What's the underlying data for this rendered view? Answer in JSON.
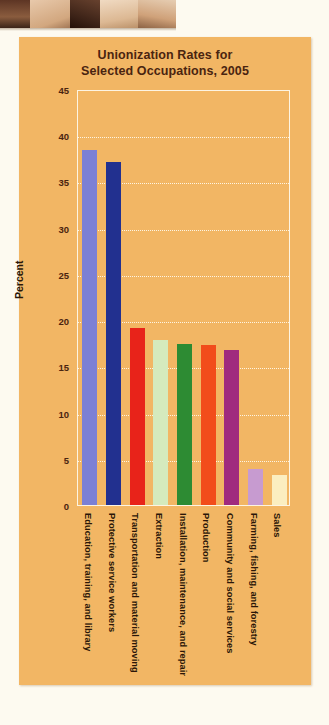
{
  "page": {
    "background_color": "#fdfaf0",
    "photo_strip_name": "cropped-photo-people"
  },
  "chart_panel": {
    "background_color": "#f2b664",
    "plot_border_color": "#fdf4e2",
    "title_line1": "Unionization Rates for",
    "title_line2": "Selected Occupations, 2005"
  },
  "chart_data": {
    "type": "bar",
    "title": "Unionization Rates for Selected Occupations, 2005",
    "xlabel": "",
    "ylabel": "Percent",
    "ylim": [
      0,
      45
    ],
    "yticks": [
      0,
      5,
      10,
      15,
      20,
      25,
      30,
      35,
      40,
      45
    ],
    "grid": true,
    "legend": "none",
    "categories": [
      "Education, training, and library",
      "Protective service workers",
      "Transportation and material moving",
      "Extraction",
      "Installation, maintenance, and repair",
      "Production",
      "Community and social services",
      "Farming, fishing, and forestry",
      "Sales"
    ],
    "values": [
      38.4,
      37.1,
      19.1,
      17.9,
      17.4,
      17.3,
      16.8,
      3.9,
      3.3
    ],
    "colors": [
      "#7c80d4",
      "#22308f",
      "#e8231a",
      "#d5eabd",
      "#2d8b33",
      "#f24c1b",
      "#a02a7e",
      "#c79bd0",
      "#fbeec0"
    ]
  }
}
